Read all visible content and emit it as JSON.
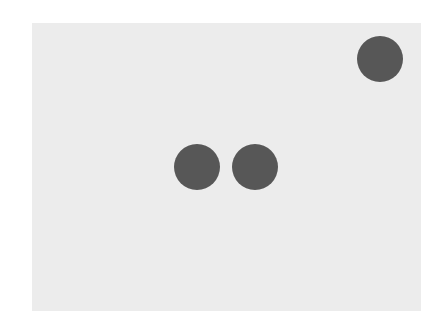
{
  "canvas": {
    "width": 444,
    "height": 326,
    "background": "#ffffff"
  },
  "field": {
    "x": 32,
    "y": 23,
    "width": 389,
    "height": 288,
    "color": "#ececec"
  },
  "dots": [
    {
      "id": "dot-top-right",
      "cx": 380,
      "cy": 59,
      "r": 23,
      "color": "#575757"
    },
    {
      "id": "dot-middle-left",
      "cx": 197,
      "cy": 167,
      "r": 23,
      "color": "#575757"
    },
    {
      "id": "dot-middle-right",
      "cx": 255,
      "cy": 167,
      "r": 23,
      "color": "#575757"
    }
  ]
}
